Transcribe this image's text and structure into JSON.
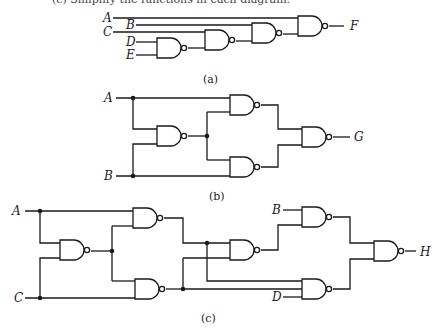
{
  "figure": {
    "top_text_clipped": "(c) Simplify the functions in each diagram.",
    "circuits": [
      {
        "id": "a",
        "caption": "(a)",
        "inputs": [
          "A",
          "B",
          "C",
          "D",
          "E"
        ],
        "output": "F",
        "gate_type": "NAND",
        "gate_count": 4
      },
      {
        "id": "b",
        "caption": "(b)",
        "inputs": [
          "A",
          "B"
        ],
        "output": "G",
        "gate_type": "NAND",
        "gate_count": 4
      },
      {
        "id": "c",
        "caption": "(c)",
        "inputs": [
          "A",
          "C",
          "B",
          "D"
        ],
        "output": "H",
        "gate_type": "NAND",
        "gate_count": 6
      }
    ]
  }
}
